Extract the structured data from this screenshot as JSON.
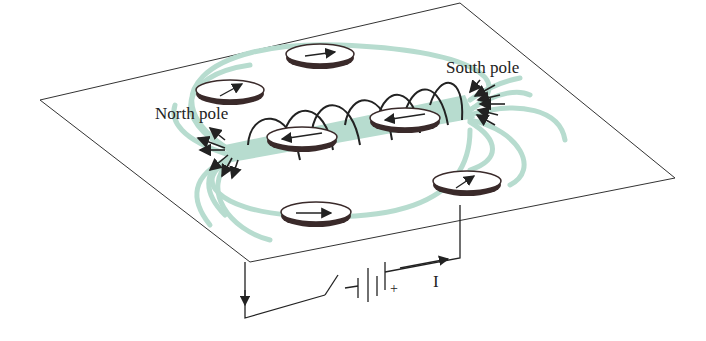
{
  "labels": {
    "north_pole": "North pole",
    "south_pole": "South pole",
    "battery_plus": "+",
    "current": "I"
  },
  "colors": {
    "field_lines": "#b7dccf",
    "ink": "#222222",
    "compass_rim": "#3a2a2a"
  },
  "compasses": [
    {
      "id": "top",
      "needle": "right"
    },
    {
      "id": "upper-left",
      "needle": "up-right"
    },
    {
      "id": "inside-left",
      "needle": "left"
    },
    {
      "id": "inside-right",
      "needle": "left"
    },
    {
      "id": "lower-right",
      "needle": "up-right"
    },
    {
      "id": "bottom",
      "needle": "right"
    }
  ]
}
